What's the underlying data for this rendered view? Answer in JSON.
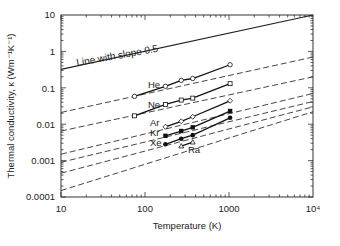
{
  "chart_data": {
    "type": "line",
    "title": "",
    "xlabel": "Temperature (K)",
    "ylabel": "Thermal conductivity, κ (Wm⁻¹K⁻¹)",
    "xscale": "log",
    "yscale": "log",
    "xlim": [
      10,
      10000
    ],
    "ylim": [
      0.0001,
      10
    ],
    "x_ticks": [
      "10",
      "100",
      "1000",
      "10⁴"
    ],
    "y_ticks": [
      "0.0001",
      "0.001",
      "0.01",
      "0.1",
      "1",
      "10"
    ],
    "grid": false,
    "legend": "inline labels",
    "annotations": [
      {
        "text": "Line with slope 0.5",
        "x": 20,
        "y": 1.0
      }
    ],
    "reference_line": {
      "name": "Line with slope 0.5",
      "x": [
        10,
        10000
      ],
      "y": [
        0.32,
        10
      ],
      "style": "solid"
    },
    "series": [
      {
        "name": "He",
        "marker": "open-circle",
        "x": [
          75,
          175,
          270,
          370,
          1030
        ],
        "y": [
          0.058,
          0.11,
          0.16,
          0.18,
          0.43
        ],
        "fit_x": [
          10,
          10000
        ],
        "fit_y": [
          0.021,
          0.7
        ]
      },
      {
        "name": "Ne",
        "marker": "open-square",
        "x": [
          75,
          175,
          270,
          370,
          1030
        ],
        "y": [
          0.017,
          0.035,
          0.046,
          0.052,
          0.13
        ],
        "fit_x": [
          10,
          10000
        ],
        "fit_y": [
          0.0065,
          0.2
        ]
      },
      {
        "name": "Ar",
        "marker": "open-diamond",
        "x": [
          175,
          270,
          370,
          1030
        ],
        "y": [
          0.0085,
          0.012,
          0.016,
          0.044
        ],
        "fit_x": [
          10,
          10000
        ],
        "fit_y": [
          0.0015,
          0.07
        ]
      },
      {
        "name": "Kr",
        "marker": "filled-square",
        "x": [
          175,
          270,
          370,
          1030
        ],
        "y": [
          0.0048,
          0.0065,
          0.0082,
          0.023
        ],
        "fit_x": [
          10,
          10000
        ],
        "fit_y": [
          0.0009,
          0.042
        ]
      },
      {
        "name": "Xe",
        "marker": "filled-circle",
        "x": [
          175,
          270,
          370,
          1030
        ],
        "y": [
          0.0028,
          0.004,
          0.005,
          0.015
        ],
        "fit_x": [
          10,
          10000
        ],
        "fit_y": [
          0.00045,
          0.03
        ]
      },
      {
        "name": "Ra",
        "marker": "open-triangle",
        "x": [
          270,
          370
        ],
        "y": [
          0.0025,
          0.0032
        ],
        "fit_x": [
          10,
          10000
        ],
        "fit_y": [
          0.00015,
          0.022
        ]
      }
    ]
  },
  "labels": {
    "slope_line": "Line with slope 0.5",
    "xlabel": "Temperature (K)",
    "ylabel": "Thermal conductivity, κ (Wm⁻¹K⁻¹)",
    "x_ticks": [
      "10",
      "100",
      "1000",
      "10⁴"
    ],
    "y_ticks": [
      "10",
      "1",
      "0.1",
      "0.01",
      "0.001",
      "0.0001"
    ],
    "series": [
      "He",
      "Ne",
      "Ar",
      "Kr",
      "Xe",
      "Ra"
    ]
  }
}
